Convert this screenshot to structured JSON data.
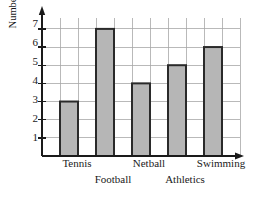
{
  "chart_data": {
    "type": "bar",
    "title": "",
    "xlabel": "",
    "ylabel": "Number of children",
    "categories": [
      "Tennis",
      "Football",
      "Netball",
      "Athletics",
      "Swimming"
    ],
    "values": [
      3,
      7,
      4,
      5,
      6
    ],
    "ylim": [
      0,
      7.6
    ],
    "y_ticks": [
      1,
      2,
      3,
      4,
      5,
      6,
      7
    ],
    "y_tick_labels": [
      "1",
      "2",
      "3",
      "4",
      "5",
      "6",
      "7"
    ],
    "grid": true,
    "legend": false,
    "bar_fill_color": "#b6b6b6",
    "bar_edge_color": "#2a2a2a",
    "grid_color": "#a8a8a8",
    "axis_color": "#1a1a1a",
    "label_rows": [
      0,
      1,
      0,
      1,
      0
    ]
  },
  "axes": {
    "y_title": "Number of children",
    "y_labels": [
      "7",
      "6",
      "5",
      "4",
      "3",
      "2",
      "1"
    ]
  },
  "x_labels": {
    "tennis": "Tennis",
    "football": "Football",
    "netball": "Netball",
    "athletics": "Athletics",
    "swimming": "Swimming"
  }
}
